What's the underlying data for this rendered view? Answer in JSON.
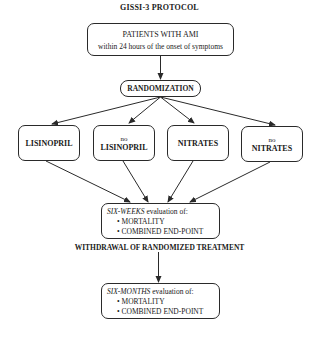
{
  "title": "GISSI-3 PROTOCOL",
  "nodes": {
    "patients": {
      "line1": "PATIENTS WITH AMI",
      "line2": "within 24 hours of the onset of symptoms"
    },
    "randomization": {
      "label": "RANDOMIZATION"
    },
    "arms": [
      {
        "prefix": "",
        "label": "LISINOPRIL"
      },
      {
        "prefix": "no",
        "label": "LISINOPRIL"
      },
      {
        "prefix": "",
        "label": "NITRATES"
      },
      {
        "prefix": "no",
        "label": "NITRATES"
      }
    ],
    "six_weeks": {
      "period": "SIX-WEEKS",
      "suffix": " evaluation of:",
      "items": [
        "• MORTALITY",
        "• COMBINED END-POINT"
      ]
    },
    "withdrawal": "WITHDRAWAL OF RANDOMIZED TREATMENT",
    "six_months": {
      "period": "SIX-MONTHS",
      "suffix": " evaluation of:",
      "items": [
        "• MORTALITY",
        "• COMBINED END-POINT"
      ]
    }
  },
  "edges": [
    [
      "patients",
      "randomization"
    ],
    [
      "randomization",
      "arm-lisinopril"
    ],
    [
      "randomization",
      "arm-no-lisinopril"
    ],
    [
      "randomization",
      "arm-nitrates"
    ],
    [
      "randomization",
      "arm-no-nitrates"
    ],
    [
      "arm-lisinopril",
      "six-weeks"
    ],
    [
      "arm-no-lisinopril",
      "six-weeks"
    ],
    [
      "arm-nitrates",
      "six-weeks"
    ],
    [
      "arm-no-nitrates",
      "six-weeks"
    ],
    [
      "withdrawal",
      "six-months"
    ]
  ]
}
